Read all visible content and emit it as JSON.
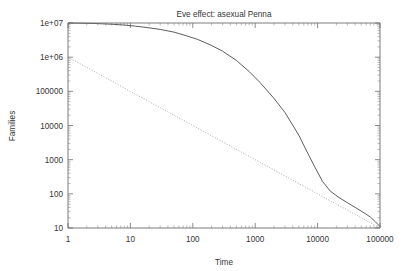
{
  "chart_data": {
    "type": "line",
    "title": "Eve effect: asexual Penna",
    "xlabel": "Time",
    "ylabel": "Families",
    "xscale": "log",
    "yscale": "log",
    "xlim": [
      1,
      100000
    ],
    "ylim": [
      10,
      10000000
    ],
    "grid": false,
    "legend": "none",
    "xticks": [
      "1",
      "10",
      "100",
      "1000",
      "10000",
      "100000"
    ],
    "xtick_values": [
      1,
      10,
      100,
      1000,
      10000,
      100000
    ],
    "yticks": [
      "10",
      "100",
      "1000",
      "10000",
      "100000",
      "1e+06",
      "1e+07"
    ],
    "ytick_values": [
      10,
      100,
      1000,
      10000,
      100000,
      1000000,
      10000000
    ],
    "series": [
      {
        "name": "families-decay-curve",
        "style": "solid",
        "color": "#4a4a4a",
        "x": [
          1,
          2,
          3,
          5,
          8,
          12,
          16,
          20,
          30,
          50,
          80,
          120,
          200,
          300,
          500,
          800,
          1200,
          2000,
          3000,
          5000,
          7000,
          9000,
          12000,
          16000,
          22000,
          30000,
          42000,
          55000,
          70000,
          85000,
          100000
        ],
        "y": [
          10000000,
          9800000,
          9600000,
          9200000,
          8700000,
          8100000,
          7600000,
          7200000,
          6500000,
          5400000,
          4200000,
          3300000,
          2200000,
          1500000,
          800000,
          380000,
          180000,
          62000,
          24000,
          5200,
          1500,
          620,
          230,
          120,
          78,
          55,
          38,
          28,
          21,
          15,
          11
        ]
      },
      {
        "name": "power-law-reference-line",
        "style": "dotted",
        "color": "#9a9a9a",
        "x": [
          1,
          10,
          100,
          1000,
          10000,
          100000
        ],
        "y": [
          1000000,
          100000,
          10000,
          1000,
          100,
          10
        ]
      }
    ],
    "annotations": []
  },
  "axes": {
    "title_label": "Eve effect: asexual Penna",
    "x_axis_label": "Time",
    "y_axis_label": "Families"
  }
}
